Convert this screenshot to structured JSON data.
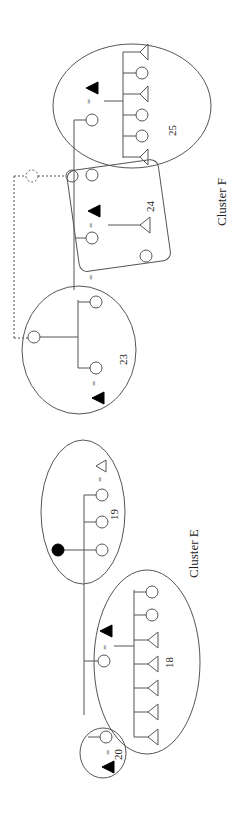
{
  "diagram": {
    "type": "kinship-diagram",
    "orientation": "rotated-90-ccw",
    "clusters": [
      {
        "label": "Cluster F",
        "groups": [
          "23",
          "24",
          "25"
        ]
      },
      {
        "label": "Cluster E",
        "groups": [
          "18",
          "19",
          "20"
        ]
      }
    ],
    "groups": {
      "g25": {
        "label": "25"
      },
      "g24": {
        "label": "24"
      },
      "g23": {
        "label": "23"
      },
      "g19": {
        "label": "19"
      },
      "g18": {
        "label": "18"
      },
      "g20": {
        "label": "20"
      }
    },
    "labels": {
      "cluster_f": "Cluster F",
      "cluster_e": "Cluster E",
      "n25": "25",
      "n24": "24",
      "n23": "23",
      "n19": "19",
      "n18": "18",
      "n20": "20",
      "marriage": "="
    },
    "legend": {
      "circle": "female",
      "triangle": "male",
      "filled": "deceased/ego marker",
      "dashed": "hypothetical link"
    },
    "colors": {
      "stroke": "#555555",
      "fill": "#000000",
      "background": "#ffffff"
    }
  }
}
